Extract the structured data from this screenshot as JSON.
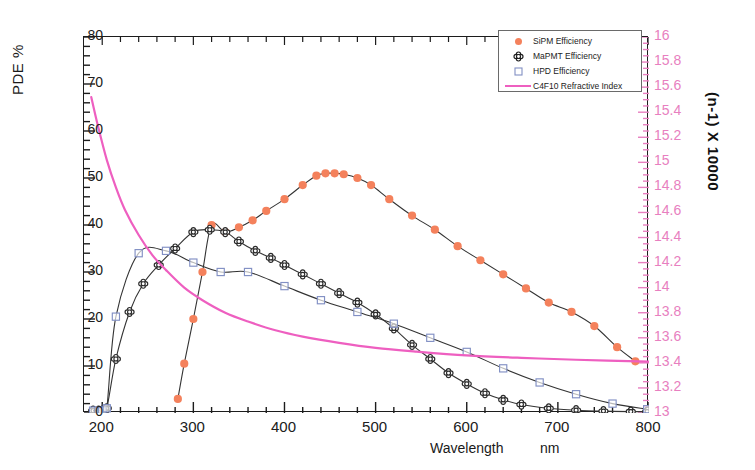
{
  "chart_data": {
    "type": "line",
    "title": "",
    "xlabel": "Wavelength",
    "xunit": "nm",
    "ylabel_left": "PDE %",
    "ylabel_right": "(n-1) X 10000",
    "xlim": [
      180,
      800
    ],
    "ylim_left": [
      0,
      80
    ],
    "ylim_right": [
      13,
      16
    ],
    "grid": false,
    "legend_position": "top-right",
    "xticks": [
      200,
      300,
      400,
      500,
      600,
      700,
      800
    ],
    "yticks_left": [
      0,
      10,
      20,
      30,
      40,
      50,
      60,
      70,
      80
    ],
    "yticks_right": [
      13,
      13.2,
      13.4,
      13.6,
      13.8,
      14,
      14.2,
      14.4,
      14.6,
      14.8,
      15,
      15.2,
      15.4,
      15.6,
      15.8,
      16
    ],
    "series": [
      {
        "name": "SiPM Efficiency",
        "color": "#f4815c",
        "marker": "filled-circle",
        "axis": "left",
        "x": [
          283,
          290,
          300,
          310,
          320,
          335,
          350,
          365,
          380,
          400,
          420,
          435,
          445,
          455,
          465,
          480,
          495,
          515,
          540,
          565,
          590,
          615,
          640,
          665,
          690,
          715,
          740,
          765,
          785
        ],
        "y": [
          3,
          10.5,
          20,
          30,
          40,
          38.5,
          39.5,
          41,
          43,
          45.5,
          48.5,
          50.5,
          51,
          51,
          50.8,
          50,
          48.5,
          45.5,
          42,
          39,
          35.5,
          32.5,
          29.5,
          26.5,
          23.5,
          21.5,
          18.5,
          14,
          11
        ]
      },
      {
        "name": "MaPMT Efficiency",
        "color": "#3a3a3a",
        "marker": "open-clover",
        "axis": "left",
        "x": [
          190,
          196,
          200,
          205,
          215,
          230,
          245,
          262,
          280,
          300,
          318,
          335,
          350,
          368,
          385,
          400,
          420,
          440,
          460,
          480,
          500,
          520,
          540,
          560,
          580,
          600,
          620,
          640,
          660,
          690,
          720,
          750,
          780,
          798
        ],
        "y": [
          0.5,
          0.5,
          0.5,
          1.0,
          11.5,
          21.5,
          27.5,
          31.5,
          35,
          38.5,
          39,
          38.5,
          36.5,
          34.5,
          33,
          31.5,
          29.5,
          27.5,
          25.5,
          23.5,
          21,
          18,
          14.5,
          11.5,
          8.5,
          6.2,
          4.2,
          2.8,
          1.8,
          1.0,
          0.6,
          0.4,
          0.3,
          0.3
        ]
      },
      {
        "name": "HPD Efficiency",
        "color": "#8290c4",
        "marker": "open-square",
        "axis": "left",
        "x": [
          190,
          196,
          200,
          205,
          215,
          240,
          270,
          300,
          330,
          360,
          400,
          440,
          480,
          520,
          560,
          600,
          640,
          680,
          720,
          760,
          798
        ],
        "y": [
          0.5,
          0.5,
          0.5,
          1.0,
          20.5,
          34,
          34.5,
          32,
          30,
          30,
          27,
          24,
          21.5,
          19,
          16,
          13,
          9.5,
          6.5,
          4,
          2.0,
          0.8
        ]
      },
      {
        "name": "C4F10  Refractive Index",
        "color": "#ee5fc0",
        "marker": "none",
        "axis": "right",
        "x": [
          188,
          195,
          205,
          215,
          225,
          240,
          255,
          270,
          290,
          310,
          335,
          360,
          390,
          420,
          460,
          500,
          545,
          600,
          660,
          720,
          800
        ],
        "y": [
          15.52,
          15.3,
          15.02,
          14.8,
          14.62,
          14.42,
          14.26,
          14.14,
          14.0,
          13.9,
          13.8,
          13.73,
          13.66,
          13.61,
          13.56,
          13.52,
          13.49,
          13.46,
          13.44,
          13.425,
          13.41
        ]
      }
    ]
  },
  "legend": {
    "items": [
      {
        "label": "SiPM Efficiency",
        "key": "filled-circle",
        "color": "#f4815c"
      },
      {
        "label": "MaPMT Efficiency",
        "key": "open-clover",
        "color": "#1c1c1c"
      },
      {
        "label": "HPD Efficiency",
        "key": "open-square",
        "color": "#8290c4"
      },
      {
        "label": "C4F10  Refractive Index",
        "key": "line",
        "color": "#ee5fc0"
      }
    ]
  },
  "axes": {
    "left": {
      "title": "PDE %",
      "ticks": [
        "80",
        "70",
        "60",
        "50",
        "40",
        "30",
        "20",
        "10",
        "0"
      ]
    },
    "right": {
      "title": "(n-1) X 10000",
      "ticks": [
        "16",
        "15.8",
        "15.6",
        "15.4",
        "15.2",
        "15",
        "14.8",
        "14.6",
        "14.4",
        "14.2",
        "14",
        "13.8",
        "13.6",
        "13.4",
        "13.2",
        "13"
      ]
    },
    "x": {
      "title": "Wavelength",
      "unit": "nm",
      "ticks": [
        "200",
        "300",
        "400",
        "500",
        "600",
        "700",
        "800"
      ]
    }
  }
}
